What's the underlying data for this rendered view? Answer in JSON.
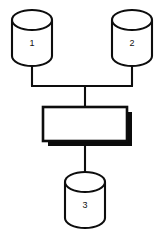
{
  "diagram": {
    "title": "",
    "background_color": "#ffffff",
    "line_color": "#0d0d0d",
    "shadow_color": "#0b0b0b",
    "fill_color": "#ffffff",
    "nodes": [
      {
        "id": "db1",
        "shape": "cylinder",
        "label": "1",
        "icon": "database-cylinder-icon",
        "x": 12,
        "y": 10,
        "width": 40,
        "height": 56
      },
      {
        "id": "db2",
        "shape": "cylinder",
        "label": "2",
        "icon": "database-cylinder-icon",
        "x": 112,
        "y": 10,
        "width": 40,
        "height": 56
      },
      {
        "id": "process",
        "shape": "rectangle",
        "label": "",
        "icon": "process-box-icon",
        "x": 43,
        "y": 107,
        "width": 84,
        "height": 34,
        "shadow_offset": 5
      },
      {
        "id": "db3",
        "shape": "cylinder",
        "label": "3",
        "icon": "database-cylinder-icon",
        "x": 65,
        "y": 172,
        "width": 40,
        "height": 56
      }
    ],
    "edges": [
      {
        "id": "edge-db1-bus",
        "from": "db1",
        "to": "bus",
        "label": ""
      },
      {
        "id": "edge-db2-bus",
        "from": "db2",
        "to": "bus",
        "label": ""
      },
      {
        "id": "edge-bus-process",
        "from": "bus",
        "to": "process",
        "label": ""
      },
      {
        "id": "edge-process-db3",
        "from": "process",
        "to": "db3",
        "label": ""
      }
    ]
  }
}
